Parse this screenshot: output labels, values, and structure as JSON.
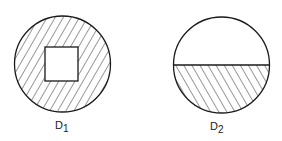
{
  "figures": [
    {
      "id": "D1",
      "label_main": "D",
      "label_sub": "1",
      "description": "Circle with hatched annular region around a central unhatched square",
      "hatch_direction": "forward-slash"
    },
    {
      "id": "D2",
      "label_main": "D",
      "label_sub": "2",
      "description": "Circle split by horizontal chord; lower segment hatched, upper segment blank",
      "hatch_direction": "back-slash"
    }
  ],
  "colors": {
    "stroke": "#1a1a1a",
    "background": "#ffffff"
  }
}
